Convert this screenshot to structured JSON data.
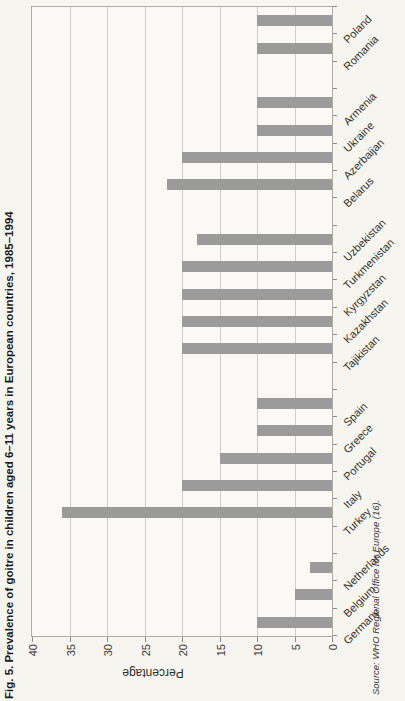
{
  "figure": {
    "title": "Fig. 5. Prevalence of goitre in children aged 6–11 years in European countries, 1985–1994",
    "source": "Source: WHO Regional Office for Europe (16)."
  },
  "chart_data": {
    "type": "bar",
    "title": "Fig. 5. Prevalence of goitre in children aged 6–11 years in European countries, 1985–1994",
    "xlabel": "",
    "ylabel": "Percentage",
    "ylim": [
      0,
      40
    ],
    "yticks": [
      0,
      5,
      10,
      15,
      20,
      25,
      30,
      35,
      40
    ],
    "grid": true,
    "legend": "none",
    "bar_color": "#9b9b9b",
    "categories": [
      "Germany",
      "Belgium",
      "Netherlands",
      "Turkey",
      "Italy",
      "Portugal",
      "Greece",
      "Spain",
      "Tajikistan",
      "Kazakhstan",
      "Kyrgyzstan",
      "Turkmenistan",
      "Uzbekistan",
      "Belarus",
      "Azerbaijan",
      "Ukraine",
      "Armenia",
      "Romania",
      "Poland"
    ],
    "values": [
      10,
      5,
      3,
      36,
      20,
      15,
      10,
      10,
      20,
      20,
      20,
      20,
      18,
      22,
      20,
      10,
      10,
      10,
      10
    ],
    "group_breaks_after_index": [
      2,
      7,
      12,
      16
    ],
    "source": "Source: WHO Regional Office for Europe (16)."
  }
}
